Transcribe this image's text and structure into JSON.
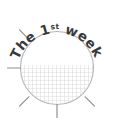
{
  "badge": {
    "title_part_1": "The ",
    "title_ordinal_number": "1",
    "title_ordinal_suffix": "st",
    "title_part_2": " week",
    "full_text": "The 1st week",
    "colors": {
      "background": "#ffffff",
      "circle_stroke": "#9a9a9a",
      "tick_stroke": "#8f8f8f",
      "hatch_line": "#d8d8d8",
      "text": "#3a3a3a"
    },
    "circle": {
      "center_x": 57,
      "center_y": 68,
      "radius": 37
    },
    "fill_region": {
      "description": "lower half crosshatch",
      "top_y": 65
    },
    "ticks": [
      {
        "name": "tick-135",
        "angle_deg": 135
      },
      {
        "name": "tick-180",
        "angle_deg": 180
      },
      {
        "name": "tick-225",
        "angle_deg": 225
      },
      {
        "name": "tick-270",
        "angle_deg": 270
      },
      {
        "name": "tick-315",
        "angle_deg": 315
      }
    ]
  }
}
